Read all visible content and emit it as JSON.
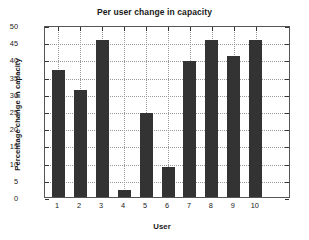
{
  "chart_data": {
    "type": "bar",
    "title": "Per user change in capacity",
    "xlabel": "User",
    "ylabel": "Percentage change in capacity",
    "categories": [
      "1",
      "2",
      "3",
      "4",
      "5",
      "6",
      "7",
      "8",
      "9",
      "10"
    ],
    "values": [
      37,
      31,
      45.5,
      2,
      24.5,
      8.7,
      39.5,
      45.5,
      41,
      45.5
    ],
    "ylim": [
      0,
      50
    ],
    "yticks": [
      0,
      5,
      10,
      15,
      20,
      25,
      30,
      35,
      40,
      45,
      50
    ],
    "ytick_labels": [
      "0",
      "5",
      "10",
      "15",
      "20",
      "25",
      "30",
      "35",
      "40",
      "45",
      "50"
    ],
    "xlim": [
      0.4,
      11.6
    ],
    "grid": true,
    "grid_style": "dotted",
    "legend": null,
    "bar_color": "#333333",
    "axes_color": "#555555",
    "grid_color": "#9a9a9a",
    "background": "#ffffff"
  }
}
